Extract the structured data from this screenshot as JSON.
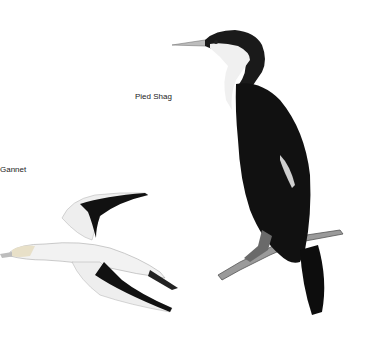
{
  "illustration": {
    "labels": {
      "pied_shag": "Pied Shag",
      "gannet": "Gannet"
    },
    "colors": {
      "background": "#ffffff",
      "plumage_dark": "#111111",
      "plumage_light": "#f2f2f2",
      "beak": "#bdbdbd"
    }
  }
}
